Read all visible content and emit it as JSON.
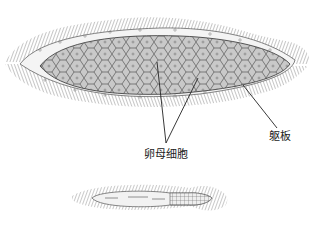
{
  "figure": {
    "type": "biological-illustration",
    "colors": {
      "background": "#ffffff",
      "cell_fill": "#c8c8c8",
      "cell_border": "#555555",
      "body_plate": "#f2f2f2",
      "cilia": "#777777",
      "leader_line": "#222222"
    }
  },
  "labels": {
    "oocyte": "卵母细胞",
    "body_plate": "躯板"
  },
  "organisms": [
    {
      "name": "female",
      "position": "top",
      "has_oocytes": true
    },
    {
      "name": "male",
      "position": "bottom",
      "has_oocytes": false
    }
  ]
}
